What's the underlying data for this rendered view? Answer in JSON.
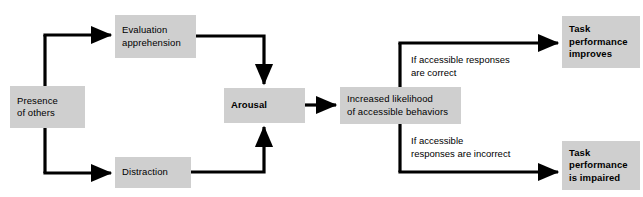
{
  "diagram": {
    "colors": {
      "node_fill": "#cfcfcf",
      "connector": "#000000",
      "text": "#000000",
      "background": "#ffffff"
    },
    "nodes": {
      "presence": {
        "lines": [
          "Presence",
          "of others"
        ],
        "bold": false
      },
      "evaluation": {
        "lines": [
          "Evaluation",
          "apprehension"
        ],
        "bold": false
      },
      "distraction": {
        "lines": [
          "Distraction"
        ],
        "bold": false
      },
      "arousal": {
        "lines": [
          "Arousal"
        ],
        "bold": true
      },
      "increased": {
        "lines": [
          "Increased likelihood",
          "of accessible behaviors"
        ],
        "bold": false
      },
      "improves": {
        "lines": [
          "Task",
          "performance",
          "improves"
        ],
        "bold": true
      },
      "impaired": {
        "lines": [
          "Task",
          "performance",
          "is impaired"
        ],
        "bold": true
      }
    },
    "edge_labels": {
      "correct": {
        "lines": [
          "If accessible responses",
          "are correct"
        ]
      },
      "incorrect": {
        "lines": [
          "If accessible",
          "responses are incorrect"
        ]
      }
    },
    "connections": [
      {
        "from": "presence",
        "to": "evaluation"
      },
      {
        "from": "presence",
        "to": "distraction"
      },
      {
        "from": "evaluation",
        "to": "arousal"
      },
      {
        "from": "distraction",
        "to": "arousal"
      },
      {
        "from": "arousal",
        "to": "increased"
      },
      {
        "from": "increased",
        "to": "improves",
        "label": "correct"
      },
      {
        "from": "increased",
        "to": "impaired",
        "label": "incorrect"
      }
    ]
  }
}
